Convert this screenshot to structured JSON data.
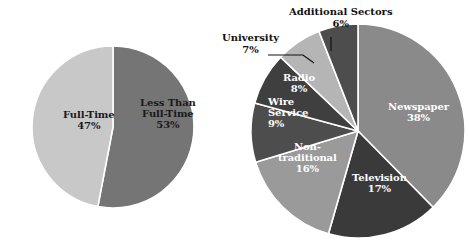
{
  "figure": {
    "background_color": "#ffffff",
    "watermark_color": "#eef1f4",
    "watermark_lines": [
      "uage",
      "nd",
      "er"
    ]
  },
  "chart_data": [
    {
      "type": "pie",
      "title": "",
      "id": "employment-status-pie",
      "position": "left",
      "center": [
        113,
        127
      ],
      "radius": 81,
      "start_angle_deg": 0,
      "direction": "clockwise",
      "legend": "none",
      "labels_inside": true,
      "categories": [
        "Less Than Full-Time",
        "Full-Time"
      ],
      "values": [
        53,
        47
      ],
      "value_suffix": "%",
      "slices": [
        {
          "label": "Less Than Full-Time",
          "label_line1": "Less Than",
          "label_line2": "Full-Time",
          "value": 53,
          "value_text": "53%",
          "color": "#757575",
          "text_color": "#1a1a1a",
          "label_x": 168,
          "label_y": 114,
          "font_size": 10
        },
        {
          "label": "Full-Time",
          "label_line1": "Full-Time",
          "label_line2": "",
          "value": 47,
          "value_text": "47%",
          "color": "#c8c8c8",
          "text_color": "#1a1a1a",
          "label_x": 89,
          "label_y": 120,
          "font_size": 10
        }
      ]
    },
    {
      "type": "pie",
      "title": "",
      "id": "media-sector-pie",
      "position": "right",
      "center": [
        358,
        131
      ],
      "radius": 107,
      "start_angle_deg": 0,
      "direction": "clockwise",
      "legend": "none",
      "labels_inside": true,
      "categories": [
        "Newspaper",
        "Television",
        "Non-traditional",
        "Wire Service",
        "Radio",
        "University",
        "Additional Sectors"
      ],
      "values": [
        38,
        17,
        16,
        9,
        8,
        7,
        6
      ],
      "value_suffix": "%",
      "slices": [
        {
          "label": "Newspaper",
          "label_line1": "Newspaper",
          "label_line2": "",
          "value": 38,
          "value_text": "38%",
          "color": "#8a8a8a",
          "text_color": "#ffffff",
          "label_x": 418,
          "label_y": 112,
          "font_size": 10
        },
        {
          "label": "Television",
          "label_line1": "Television",
          "label_line2": "",
          "value": 17,
          "value_text": "17%",
          "color": "#3a3a3a",
          "text_color": "#ffffff",
          "label_x": 379,
          "label_y": 183,
          "font_size": 10
        },
        {
          "label": "Non-traditional",
          "label_line1": "Non-",
          "label_line2": "traditional",
          "value": 16,
          "value_text": "16%",
          "color": "#9a9a9a",
          "text_color": "#ffffff",
          "label_x": 307,
          "label_y": 158,
          "font_size": 10
        },
        {
          "label": "Wire Service",
          "label_line1": "Wire",
          "label_line2": "Service",
          "value": 9,
          "value_text": "9%",
          "color": "#4d4d4d",
          "text_color": "#ffffff",
          "label_x": 288,
          "label_y": 113,
          "font_size": 10
        },
        {
          "label": "Radio",
          "label_line1": "Radio",
          "label_line2": "",
          "value": 8,
          "value_text": "8%",
          "color": "#3f3f3f",
          "text_color": "#ffffff",
          "label_x": 299,
          "label_y": 83,
          "font_size": 10
        },
        {
          "label": "University",
          "label_line1": "University",
          "label_line2": "",
          "value": 7,
          "value_text": "7%",
          "color": "#b5b5b5",
          "text_color": "#111111",
          "callout": true,
          "callout_x": 222,
          "callout_y": 32,
          "font_size": 10,
          "leader": {
            "x1": 268,
            "y1": 55,
            "x2": 303,
            "y2": 55,
            "x3": 314,
            "y3": 63
          }
        },
        {
          "label": "Additional Sectors",
          "label_line1": "Additional Sectors",
          "label_line2": "",
          "value": 6,
          "value_text": "6%",
          "color": "#4d4d4d",
          "text_color": "#111111",
          "callout": true,
          "callout_x": 289,
          "callout_y": 6,
          "font_size": 10,
          "leader": {
            "x1": 331,
            "y1": 37,
            "x2": 331,
            "y2": 51,
            "x3": 331,
            "y3": 51
          }
        }
      ]
    }
  ]
}
